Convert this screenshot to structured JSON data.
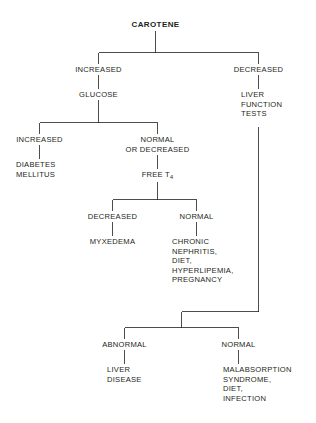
{
  "diagram": {
    "title": "CAROTENE",
    "root": {
      "label": "CAROTENE"
    },
    "branches": {
      "increased": "INCREASED",
      "decreased": "DECREASED",
      "liver_function_tests": "LIVER\nFUNCTION\nTESTS",
      "glucose": "GLUCOSE",
      "glucose_increased": "INCREASED",
      "diabetes_mellitus": "DIABETES\nMELLITUS",
      "normal_or_decreased": "NORMAL\nOR DECREASED",
      "free_t4_prefix": "FREE T",
      "free_t4_sub": "4",
      "t4_decreased": "DECREASED",
      "myxedema": "MYXEDEMA",
      "t4_normal": "NORMAL",
      "chronic_list": "CHRONIC\nNEPHRITIS,\nDIET,\nHYPERLIPEMIA,\nPREGNANCY",
      "lft_abnormal": "ABNORMAL",
      "liver_disease": "LIVER\nDISEASE",
      "lft_normal": "NORMAL",
      "malabsorption_list": "MALABSORPTION\nSYNDROME,\nDIET,\nINFECTION"
    },
    "style": {
      "line_color": "#231f20",
      "text_color": "#231f20",
      "background": "#ffffff",
      "line_width": 0.8
    }
  }
}
